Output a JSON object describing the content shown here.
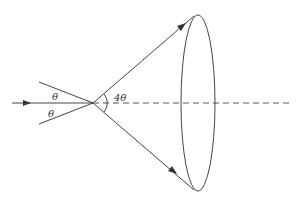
{
  "diagram": {
    "labels": {
      "theta_upper": "θ",
      "theta_lower": "θ",
      "cone_angle": "4θ"
    },
    "colors": {
      "stroke": "#444444",
      "background": "#ffffff"
    },
    "elements": [
      "incident-ray-arrow",
      "upper-incident-line",
      "lower-incident-line",
      "optical-axis-dashed",
      "upper-cone-ray-arrow",
      "lower-cone-ray-arrow",
      "cone-angle-arc",
      "cone-base-ellipse"
    ]
  }
}
